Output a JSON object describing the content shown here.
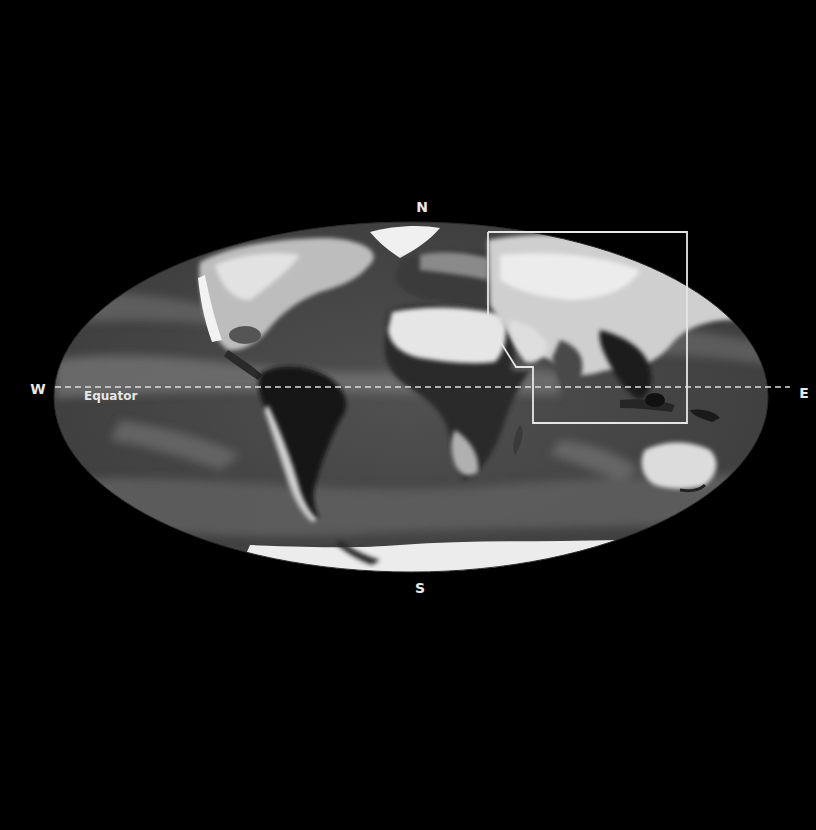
{
  "map": {
    "projection": "Mollweide (elliptical world map)",
    "style": "grayscale satellite-derived global map",
    "colors": {
      "background": "#000000",
      "ocean": "#4a4a4a",
      "ocean_light_band": "#6a6a6a",
      "land_dark": "#1a1a1a",
      "land_light": "#d8d8d8",
      "ice": "#eeeeee",
      "outline": "#e6e6e6",
      "equator_line": "#dcdcdc"
    }
  },
  "labels": {
    "north": "N",
    "south": "S",
    "west": "W",
    "east": "E",
    "equator": "Equator"
  },
  "highlight_region": {
    "description": "White outlined region covering Middle East, Central/South/East Asia and Southeast Asia",
    "shape": "polyline box"
  }
}
